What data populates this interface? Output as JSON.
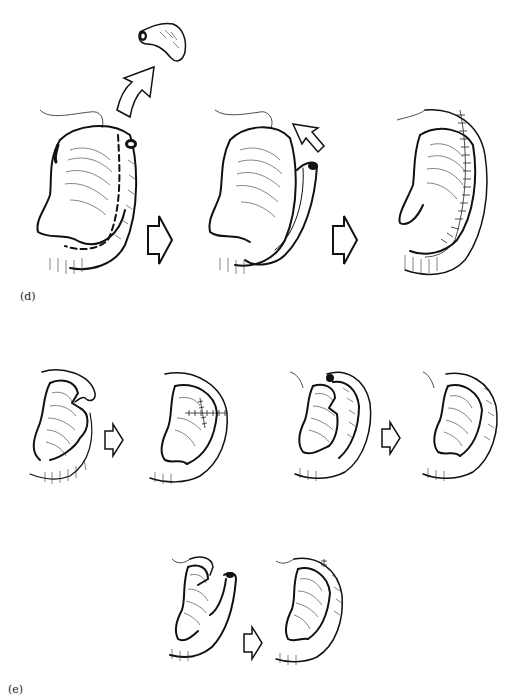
{
  "figure": {
    "panels": [
      {
        "label": "(d)",
        "description": "Ear reconstruction: excision of helical rim segment, rotation of tubed helical flap, and sutured result",
        "steps": [
          {
            "name": "excised-fragment",
            "note": "Excised cartilage/tissue fragment removed upward"
          },
          {
            "name": "ear-step-1",
            "note": "Ear with dashed incision line along helical rim and tubed rim end"
          },
          {
            "name": "ear-step-2",
            "note": "Helical rim advanced as tubed flap, rotation arrow"
          },
          {
            "name": "ear-step-3",
            "note": "Reconstructed ear with sutures along helix"
          }
        ]
      },
      {
        "label": "(e)",
        "description": "Additional variations of helical rim reconstruction",
        "steps": [
          {
            "name": "variant-a-before",
            "note": "Notched upper ear defect"
          },
          {
            "name": "variant-a-after",
            "note": "Closed defect with cross-stitched sutures"
          },
          {
            "name": "variant-b-before",
            "note": "Helical rim flap separated"
          },
          {
            "name": "variant-b-after",
            "note": "Rim re-approximated"
          },
          {
            "name": "variant-c-before",
            "note": "Helical flap lifted from lower ear"
          },
          {
            "name": "variant-c-after",
            "note": "Helix reconstructed with suture line at top"
          }
        ]
      }
    ],
    "arrow_icon": "hollow-right-arrow",
    "curved_arrow_icon": "hollow-up-arrow",
    "colors": {
      "ink": "#111111",
      "background": "#ffffff",
      "stipple": "#888888"
    }
  }
}
